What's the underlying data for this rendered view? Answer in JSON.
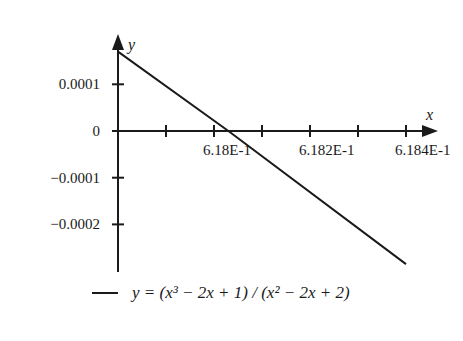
{
  "chart_data": {
    "type": "line",
    "title": "",
    "xlabel": "x",
    "ylabel": "y",
    "x_ticks": [
      {
        "value": 0.6179,
        "label": ""
      },
      {
        "value": 0.618,
        "label": "6.18E-1"
      },
      {
        "value": 0.6181,
        "label": ""
      },
      {
        "value": 0.6182,
        "label": "6.182E-1"
      },
      {
        "value": 0.6183,
        "label": ""
      },
      {
        "value": 0.6184,
        "label": "6.184E-1"
      }
    ],
    "y_ticks": [
      {
        "value": 0.0001,
        "label": "0.0001"
      },
      {
        "value": 0,
        "label": "0"
      },
      {
        "value": -0.0001,
        "label": "−0.0001"
      },
      {
        "value": -0.0002,
        "label": "−0.0002"
      }
    ],
    "xlim": [
      0.6178,
      0.6184
    ],
    "ylim": [
      -0.0003,
      0.0002
    ],
    "grid": false,
    "legend_position": "bottom",
    "series": [
      {
        "name": "y = (x^3 - 2x + 1)/(x^2 - 2x + 2)",
        "x": [
          0.6178,
          0.61803,
          0.6184
        ],
        "y": [
          0.00017,
          0.0,
          -0.000285
        ]
      }
    ]
  },
  "legend": {
    "label": "y = (x³ − 2x + 1) / (x² − 2x + 2)"
  },
  "axes": {
    "x_name": "x",
    "y_name": "y"
  }
}
